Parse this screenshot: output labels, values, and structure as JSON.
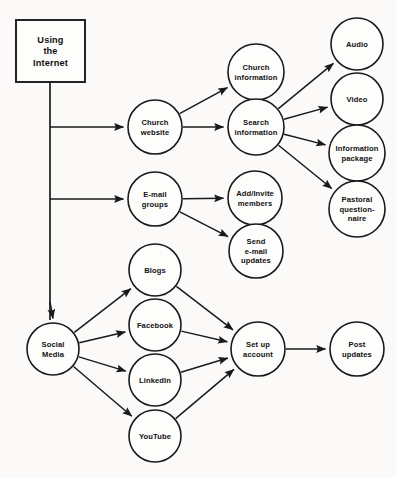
{
  "diagram": {
    "type": "flowchart",
    "background_color": "#fbfaf8",
    "stroke_color": "#1a1a1a",
    "node_fill_color": "#fdfdfc",
    "root": {
      "id": "root",
      "label_lines": [
        "Using",
        "the",
        "Internet"
      ],
      "shape": "rectangle",
      "x": 16,
      "y": 20,
      "width": 69,
      "height": 62
    },
    "nodes": [
      {
        "id": "church-website",
        "label_lines": [
          "Church",
          "website"
        ],
        "cx": 155,
        "cy": 127,
        "r": 27
      },
      {
        "id": "email-groups",
        "label_lines": [
          "E-mail",
          "groups"
        ],
        "cx": 155,
        "cy": 199,
        "r": 27
      },
      {
        "id": "social-media",
        "label_lines": [
          "Social",
          "Media"
        ],
        "cx": 53,
        "cy": 349,
        "r": 26
      },
      {
        "id": "church-information",
        "label_lines": [
          "Church",
          "information"
        ],
        "cx": 256,
        "cy": 72,
        "r": 28
      },
      {
        "id": "search-information",
        "label_lines": [
          "Search",
          "information"
        ],
        "cx": 256,
        "cy": 127,
        "r": 28
      },
      {
        "id": "add-invite-members",
        "label_lines": [
          "Add/Invite",
          "members"
        ],
        "cx": 255,
        "cy": 198,
        "r": 27
      },
      {
        "id": "send-email-updates",
        "label_lines": [
          "Send",
          "e-mail",
          "updates"
        ],
        "cx": 256,
        "cy": 251,
        "r": 27
      },
      {
        "id": "audio",
        "label_lines": [
          "Audio"
        ],
        "cx": 357,
        "cy": 44,
        "r": 26
      },
      {
        "id": "video",
        "label_lines": [
          "Video"
        ],
        "cx": 357,
        "cy": 99,
        "r": 26
      },
      {
        "id": "information-package",
        "label_lines": [
          "Information",
          "package"
        ],
        "cx": 357,
        "cy": 153,
        "r": 28
      },
      {
        "id": "pastoral-questionnaire",
        "label_lines": [
          "Pastoral",
          "question-",
          "naire"
        ],
        "cx": 357,
        "cy": 209,
        "r": 28
      },
      {
        "id": "blogs",
        "label_lines": [
          "Blogs"
        ],
        "cx": 155,
        "cy": 270,
        "r": 26
      },
      {
        "id": "facebook",
        "label_lines": [
          "Facebook"
        ],
        "cx": 155,
        "cy": 325,
        "r": 26
      },
      {
        "id": "linkedin",
        "label_lines": [
          "LinkedIn"
        ],
        "cx": 155,
        "cy": 380,
        "r": 26
      },
      {
        "id": "youtube",
        "label_lines": [
          "YouTube"
        ],
        "cx": 155,
        "cy": 436,
        "r": 26
      },
      {
        "id": "set-up-account",
        "label_lines": [
          "Set up",
          "account"
        ],
        "cx": 258,
        "cy": 349,
        "r": 27
      },
      {
        "id": "post-updates",
        "label_lines": [
          "Post",
          "updates"
        ],
        "cx": 357,
        "cy": 349,
        "r": 27
      }
    ],
    "trunk": {
      "from_x": 50,
      "from_y": 82,
      "to_y": 320
    },
    "edges": [
      {
        "from": "root",
        "to": "church-website",
        "kind": "branch"
      },
      {
        "from": "root",
        "to": "email-groups",
        "kind": "branch"
      },
      {
        "from": "root",
        "to": "social-media",
        "kind": "trunk-down"
      },
      {
        "from": "church-website",
        "to": "church-information",
        "kind": "diagonal"
      },
      {
        "from": "church-website",
        "to": "search-information",
        "kind": "straight"
      },
      {
        "from": "search-information",
        "to": "audio",
        "kind": "diagonal"
      },
      {
        "from": "search-information",
        "to": "video",
        "kind": "diagonal"
      },
      {
        "from": "search-information",
        "to": "information-package",
        "kind": "diagonal"
      },
      {
        "from": "search-information",
        "to": "pastoral-questionnaire",
        "kind": "diagonal"
      },
      {
        "from": "email-groups",
        "to": "add-invite-members",
        "kind": "straight"
      },
      {
        "from": "email-groups",
        "to": "send-email-updates",
        "kind": "diagonal"
      },
      {
        "from": "social-media",
        "to": "blogs",
        "kind": "diagonal"
      },
      {
        "from": "social-media",
        "to": "facebook",
        "kind": "diagonal"
      },
      {
        "from": "social-media",
        "to": "linkedin",
        "kind": "diagonal"
      },
      {
        "from": "social-media",
        "to": "youtube",
        "kind": "diagonal"
      },
      {
        "from": "blogs",
        "to": "set-up-account",
        "kind": "diagonal"
      },
      {
        "from": "facebook",
        "to": "set-up-account",
        "kind": "diagonal"
      },
      {
        "from": "linkedin",
        "to": "set-up-account",
        "kind": "diagonal"
      },
      {
        "from": "youtube",
        "to": "set-up-account",
        "kind": "diagonal"
      },
      {
        "from": "set-up-account",
        "to": "post-updates",
        "kind": "straight"
      }
    ]
  }
}
